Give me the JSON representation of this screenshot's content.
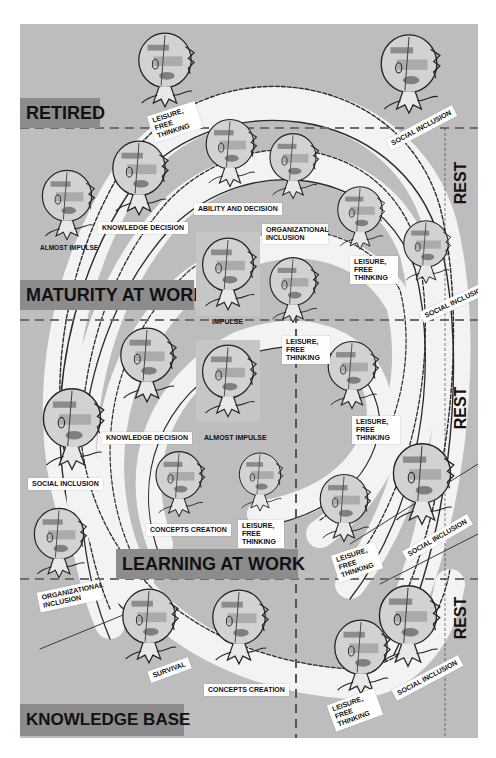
{
  "diagram": {
    "type": "spiral life-stage diagram",
    "colors": {
      "background": "#bdbdbd",
      "zone_label_bg": "#8c8c8c",
      "spiral_band": "#f4f4f4",
      "line": "#2a2a2a",
      "divider": "#6e6e6e"
    },
    "zones": [
      {
        "id": "retired",
        "label": "RETIRED"
      },
      {
        "id": "maturity",
        "label": "MATURITY AT WORK"
      },
      {
        "id": "learning",
        "label": "LEARNING AT WORK"
      },
      {
        "id": "knowledge",
        "label": "KNOWLEDGE BASE"
      }
    ],
    "rest_labels": [
      "REST",
      "REST",
      "REST"
    ],
    "figures": [
      {
        "id": "f1",
        "zone": "retired",
        "caption": "LEISURE, FREE THINKING"
      },
      {
        "id": "f2",
        "zone": "retired",
        "caption": "SOCIAL INCLUSION"
      },
      {
        "id": "f3",
        "zone": "maturity",
        "caption": "ALMOST IMPULSE"
      },
      {
        "id": "f4",
        "zone": "maturity",
        "caption": "KNOWLEDGE DECISION"
      },
      {
        "id": "f5",
        "zone": "maturity",
        "caption": "ABILITY AND DECISION"
      },
      {
        "id": "f6",
        "zone": "maturity",
        "caption": "ORGANIZATIONAL INCLUSION"
      },
      {
        "id": "f7",
        "zone": "maturity",
        "caption": "LEISURE, FREE THINKING"
      },
      {
        "id": "f8",
        "zone": "maturity",
        "caption": "SOCIAL INCLUSION"
      },
      {
        "id": "f9",
        "zone": "maturity",
        "caption": "IMPULSE"
      },
      {
        "id": "f10",
        "zone": "maturity",
        "caption": "LEISURE, FREE THINKING"
      },
      {
        "id": "f11",
        "zone": "learning",
        "caption": "KNOWLEDGE DECISION"
      },
      {
        "id": "f12",
        "zone": "learning",
        "caption": "ALMOST IMPULSE"
      },
      {
        "id": "f13",
        "zone": "learning",
        "caption": "LEISURE, FREE THINKING"
      },
      {
        "id": "f14",
        "zone": "learning",
        "caption": "SOCIAL INCLUSION"
      },
      {
        "id": "f15",
        "zone": "learning",
        "caption": "CONCEPTS CREATION"
      },
      {
        "id": "f16",
        "zone": "learning",
        "caption": "LEISURE, FREE THINKING"
      },
      {
        "id": "f17",
        "zone": "learning",
        "caption": "LEISURE, FREE THINKING"
      },
      {
        "id": "f18",
        "zone": "learning",
        "caption": "SOCIAL INCLUSION"
      },
      {
        "id": "f19",
        "zone": "learning",
        "caption": "ORGANIZATIONAL INCLUSION"
      },
      {
        "id": "f20",
        "zone": "knowledge",
        "caption": "SURVIVAL"
      },
      {
        "id": "f21",
        "zone": "knowledge",
        "caption": "CONCEPTS CREATION"
      },
      {
        "id": "f22",
        "zone": "knowledge",
        "caption": "LEISURE, FREE THINKING"
      },
      {
        "id": "f23",
        "zone": "knowledge",
        "caption": "SOCIAL INCLUSION"
      }
    ]
  }
}
